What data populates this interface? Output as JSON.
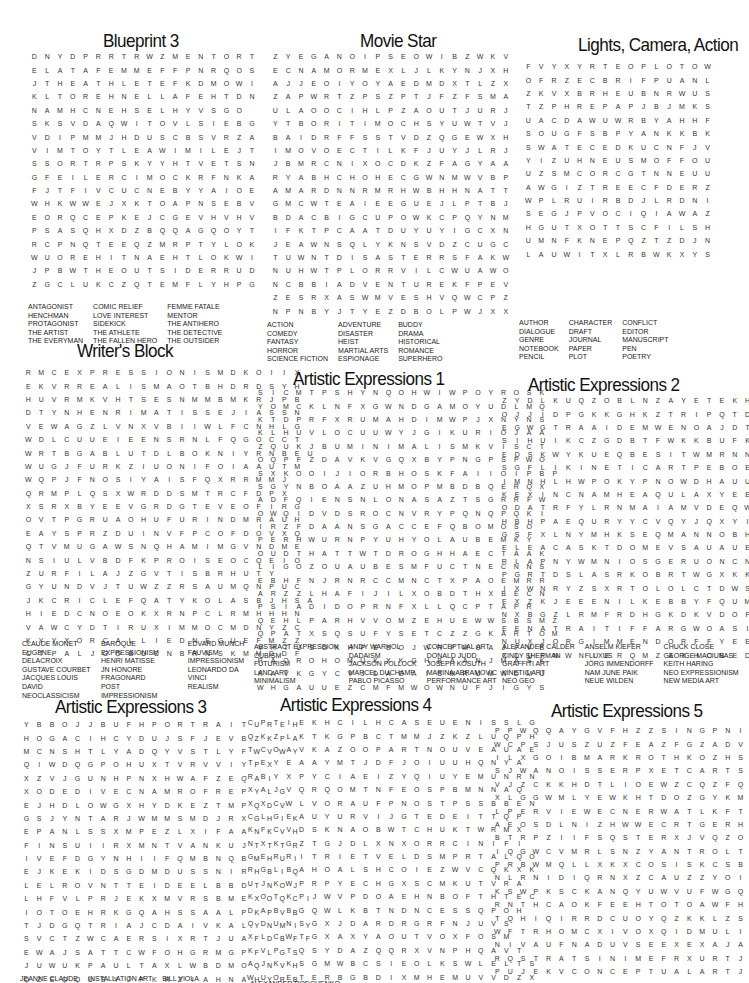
{
  "puzzles": [
    {
      "title": "Blueprint 3",
      "rows": [
        "DNYDPRRTRWZMENTORT",
        "ELATAFEMMEFFPNRQOS",
        "JTHEATHLETEFKDMOWI",
        "KLTOREHNELLAFEHTDN",
        "NAMHCNEHSELHYVSGO",
        "SKSVDAQWITOVLSIEBG",
        "VDIPMMJHDUSCBSVRZA",
        "VIMTOYTLEAWIMILEJT",
        "SSORTRPSKYYHTVETSN",
        "GFEILERCIMOCKRFNKA",
        "FJTFIVCUCNEBYYAIOE",
        "WHKWWEJXKTOAPNSEBV",
        "EORQCEPKEJCGEVHVHV",
        "PSASQHXDZBQQAGQOYT",
        "RCPNQTEEQZMRPTYLOK",
        "WUOREHITNAEHTLOKWI",
        "JPBWTHEOUTSIDERRUD",
        "ZGCLUKCZQTEMFLYHPG"
      ],
      "words": [
        [
          "ANTAGONIST",
          "HENCHMAN",
          "PROTAGONIST",
          "THE ARTIST",
          "THE EVERYMAN"
        ],
        [
          "COMIC RELIEF",
          "LOVE INTEREST",
          "SIDEKICK",
          "THE ATHLETE",
          "THE FALLEN HERO"
        ],
        [
          "FEMME FATALE",
          "MENTOR",
          "THE ANTIHERO",
          "THE DETECTIVE",
          "THE OUTSIDER"
        ]
      ]
    },
    {
      "title": "Movie Star",
      "rows": [
        "ZYEGANOIPSEOWIBZWKV",
        "ECNAMORMEXLJLKYNJXH",
        "AJJEOIYOYAEDMDXTLZX",
        "ZAPWRTZPSZPTJFZFSMA",
        "ULAOOCIHLPZAOUTJURJ",
        "YTBORITIMOCHSYUWTVJ",
        "BAIDRFFSSTVDZQGEWXH",
        "IMOVOECTILKFJUYJLRJ",
        "JBMRCNIXOCDKZFAGYAA",
        "RYABHCHOHECGWNMWVBP",
        "AMARDNNRMRHWBHHNATT",
        "GMCWTEAIEEGUEJLPTBJ",
        "BDACBIGCUPOWKCPQYNM",
        "IFKTPCAATDUYUYIGCXN",
        "JEAWNSQLYKNSVDZCUGC",
        "TUWNTDISASTERRSFAKW",
        "NUHWTPLORRVILCWUAWO",
        "NCBBIADVENTUREKFPEV",
        "ZESRXASWMVESHVQWCPZ",
        "NPNBYJTYEZDBOLPWJXX"
      ],
      "words": [
        [
          "ACTION",
          "COMEDY",
          "FANTASY",
          "HORROR",
          "SCIENCE FICTION"
        ],
        [
          "ADVENTURE",
          "DISASTER",
          "HEIST",
          "MARTIAL ARTS",
          "ESPIONAGE"
        ],
        [
          "BUDDY",
          "DRAMA",
          "HISTORICAL",
          "ROMANCE",
          "SUPERHERO"
        ]
      ]
    },
    {
      "title": "Lights, Camera, Action",
      "rows": [
        "FVYXYRTEOPLOTOW",
        "OFRZECBRIFPUANL",
        "ZKVXBRHEUBNRWUS",
        "TZPHREPAPJBJMKS",
        "UACDAWUWRBYAHHF",
        "SOUGFSBPYANKKBK",
        "SWATECEDKUCNFJV",
        "YIZUHNEUSMOFFOU",
        "UZSMCORCGTNNEUU",
        "AWGIZTREECFDERZ",
        "WPLRUIRBDJLRDNI",
        "SEGJPVOCIQIAWAZ",
        "HGUTXOTTSCFILSH",
        "UMNFKNEPQZTZDJN",
        "LAUWITXLRBWKXYS"
      ],
      "words": [
        [
          "AUTHOR",
          "DIALOGUE",
          "GENRE",
          "NOTEBOOK",
          "PENCIL"
        ],
        [
          "CHARACTER",
          "DRAFT",
          "JOURNAL",
          "PAPER",
          "PLOT"
        ],
        [
          "CONFLICT",
          "EDITOR",
          "MANUSCRIPT",
          "PEN",
          "POETRY"
        ]
      ]
    },
    {
      "title": "Writer's Block",
      "rows": [
        "RMCEXPRESSIONISMDKOIIX",
        "EKVRREALISMAOTBHDRDSYH",
        "HUVRMKVHTSESNMMBMKRJPB",
        "DTYNHENRIMATISSEJIASSN",
        "VEWAGZLVNXVBIIWLFCNHLG",
        "WDLCUUEIEENSRNLFQGOCCT",
        "WRTBGABLUTDLBOKNIYRNBEU",
        "WUGJFURKZIUONIFOIAAUTM",
        "WQPJFNOSIYAISFQXRRMMJ",
        "QRMPLQSXWRDDSMTRCFDPX",
        "XSRXBYEEVGRDGTEVEOFIRG",
        "OVTPGRUAOHUFURINDMRAUH",
        "EAYSPRZDUINVFPCOFDOVXQ",
        "QTVMUGAWSNQHAMIMGVNDME",
        "NSIULVBDFKPROISEOCQEIO",
        "ZURFILAJZGVTISBRHUTY",
        "GYUNDVJTUWZZRSAUMQNPUC",
        "JKCRICLEFQATYKOLASBJHSA",
        "HIEDCNOEOKXRNPCLRMHHHN",
        "VAWCYDTIRUXIMMOCMDNYZC",
        "KYYXORCALLIEDNEGUEFMZZ",
        "CTPALJGOBUCNBRNSKMMDDF"
      ],
      "words": [
        [
          "CLAUDE MONET",
          "EUGENE DELACROIX",
          "GUSTAVE COURBET",
          "JACQUES LOUIS DAVID",
          "NEOCLASSICISM"
        ],
        [
          "BAROQUE",
          "EXPRESSIONISM",
          "HENRI MATISSE",
          "JN HONORE FRAGONARD",
          "POST IMPRESSIONISM"
        ],
        [
          "EDVARD MUNCH",
          "FAUVISM",
          "IMPRESSIONISM",
          "LEONARDO DA VINCI",
          "REALISM"
        ]
      ]
    },
    {
      "title": "Artistic Expressions 1",
      "rows": [
        "SICMTPSHYNQOHWIWPOYROSK",
        "YOMCKLNFXGWNDGAMOYUDLMQ",
        "KTDPRFXRUMAHDIMWPJXNYNS",
        "KLHUVLOCUUWYJGIKURIOJAA",
        "ZQUKJBUMINIMALISMKVISCT",
        "OQPFZDAVKVGQXBYPNGPSPWO",
        "SXKOOIJIORBHOSKFAIIOIPBP",
        "SGYNBOAAZUHMOPMBDBQERQX",
        "ADFQIENSNLONASAZTSGRRFW",
        "OWQIDVDSROCNVRYPQNQPQKI",
        "IRZFDAANSGACCEFQBOMOSO",
        "PERHWURNPYUHYOLAUBEMKY",
        "OUDTHATTWTDROGHHAECTAAK",
        "LIGOZOUAUBESMFUCTNECNNS",
        "EBHFNJRNRCCMNCTXPAOEMRR",
        "ARZZLHAFIJILXOBDTHXBECN",
        "PSIADIDOPRNFXLLQCPTAPR",
        "QEHLPARHVVOMZEHUEWWSBSMZ",
        "QPATXSQSUFYSETCZZGKARTOM",
        "VHTUSOKHPESOJWRFMUAJFVE",
        "RAOROHOMUKXKGHBAANJMASK",
        "KAVKGYCVJDADAISMRUMWDMU",
        "WHGAUUEZCMFMWOWNUFJIGYS"
      ],
      "words": [
        [
          "ABSTRACT EXPRESSION",
          "CUBISM",
          "FUTURISM",
          "LAND ART",
          "MINIMALISM"
        ],
        [
          "ANDY WARHOL",
          "DADAISM",
          "JACKSON POLLOCK",
          "MARCEL DUCHAMP",
          "PABLO PICASSO"
        ],
        [
          "CONCEPTUAL ART",
          "DONALD JUDD",
          "JOSEPH KOSUTH",
          "MARINA ABRAMOVIC",
          "PERFORMANCE ART"
        ]
      ]
    },
    {
      "title": "Artistic Expressions 2",
      "rows": [
        "ZYDLKUQZOBLNZAYETEKHA",
        "OJJIDPGKKGHKZTRIPQTDF",
        "EGWGTRAAIDEMWENOAJDTU",
        "SIHUIKCZGDBTFWKKBUFKO",
        "EDSKWYKUEQBESITWMRNNE",
        "SGFLIKINETICARTPEBOEG",
        "IMNHLHWPOKYPNOWDHAUUO",
        "KEXINCNAMHEAQULAXYEE",
        "ODATRFYLRNMAIAMVDEQWN",
        "HBHPAEQURYYCVQYJQXYIO",
        "GSFXLNYMHKSEQMANNOBHB",
        "ELEACASKTDOMEVSAUAUEY",
        "RLAPNYWMNIOSGERUONCNW",
        "PGRTDSLASRKOBRTWGXKKL",
        "IXWNRYZSXRTOLOLCTDWSZ",
        "EXZKJEEENILKEBBYFQUMH",
        "NXBGZLRMFRDHGKDKVDOFB",
        "EENATRAITIFFARGWOASIZ",
        "NUXJORGIMMENDORFFYEEJ",
        "XLUFNWNIERQMZAXHOBEDQ"
      ],
      "words": [
        [
          "ALEXANDER CALDER",
          "CINDY SHERMAN",
          "GRAFFITI ART",
          "KINETIC ART",
          "NEO GEO"
        ],
        [
          "ANSELM KIEFER",
          "FLUXUS",
          "JÖRG IMMENDORFF",
          "NAM JUNE PAIK",
          "NEUE WILDEN"
        ],
        [
          "CHUCK CLOSE",
          "GEORGE MACIUNAS",
          "KEITH HARING",
          "NEO EXPRESSIONISM",
          "NEW MEDIA ART"
        ]
      ]
    },
    {
      "title": "Artistic Expressions 3",
      "rows": [
        "YBBOJJBUFHPORTRAITUREH",
        "HOGACIHCYDUJSFJEVBZKPA",
        "MCNSHTLYADQYVSTLYFWVWY",
        "QIWDQGPOHUXTVRVVIYPX",
        "XZVJGUNHPNXHWAFZEQAI",
        "XODEDIVECNAMROFREPYLG",
        "EJHDLOWGXHYDKEZTMPQDV",
        "GSJYNTARJWMMSMDJRXGHIK",
        "EPANLSSXMPEZLXIFAANKVH",
        "FINSUIIRXMNTVANKUJTTTR",
        "IVEFDGYNHIIFQMBNQBMHUI",
        "EJKEKIDSGDMDUSSNIRHBIQ",
        "LELROVNTTEIDEELBBDTNOJ",
        "LHFVLPRJEKXMVRSBMEXOQCI",
        "IOTOEHRKGQAHSSAALPKPVB",
        "TJDGQTRIAJCDAIVKALYNMIY",
        "SVCTZWCAERSIXRTJUAFDBFF",
        "EWAJSATTCWFOHGRMGPFLGS",
        "JUWUKPAULTAXLWBDMOQNVH",
        "QZEQQUSYJPKRZIAHNAHYRB",
        "OTYZZIVYURTQDAJLITUOCW",
        "VKPTJWAJRLMMORUTUXYOHV"
      ],
      "words": [
        [
          "JEANNE CLAUDE"
        ],
        [
          "INSTALLATION ART"
        ],
        [
          "BILL VIOLA"
        ]
      ]
    },
    {
      "title": "Artistic Expressions 4",
      "rows": [
        "CPTIEKHCILHCASEUENISSLG",
        "QKZLKTKGPBCTMMJZKZLUQPH",
        "TCOAVKAZOOPARTNOUVEAUAE",
        "TEYEAAYMTJDFJOIUUHQNYA",
        "RBYXPYCIAEIZYQIUYEMUNRN",
        "XAJVQRQOMTNFEOSPBMNNAQ",
        "XXCWLVORAUFPNOSTPSSBBEN",
        "CLGEAUYURVIJGTEDEITTQP",
        "KFCVDSKNAOBWTCHUKTWRMX",
        "NXKGZTGJDLXNXORRCINIFI",
        "GERRITRIETVELDSMPRTALQO",
        "RGLBAHOALSHCOIEZWVCQKXK",
        "UJKWPRPYECHGXSCMKUTVRA",
        "KOTKPJWVPDOAEHNBOFTHTEC",
        "DABBGQWLKBTNDNCESSQPOH",
        "QDUNSGXJDARDRGRFNJUVS",
        "XLCWTGXAXYAOUTVOXFOSM",
        "KVPTQSYDAZQQRXVNPHQAVT",
        "AJKKSGMWBCSIEOLKSWLELTS",
        "WUOETERBGBDIXMHEMUVVDZX",
        "YVJDZJDWKVFGMUDCHLARL",
        "TCALEXANDERRODCHENKOLOW"
      ],
      "words": [
        [
          "ALEXANDER RODCHENKO"
        ]
      ]
    },
    {
      "title": "Artistic Expressions 5",
      "rows": [
        "PPWQQAYGVFHZZSINGPNILMV",
        "WCPSJUSZUZFEAZFGZADVJAD",
        "ILXGOIBMARKROTHKOZHSMHS",
        "SJWANOISSERPXETCARTSBAE",
        "VJZCKKHDTLIOEWZCQZFQXRS",
        "XLGGWMLYEWKHTDOZGYKMQZ",
        "LPERVIEWECNERWATLKFTOHB",
        "AEOSDLNIZHWWECRTGERHLAK",
        "BTRPZIIFSQSTERXJVQZOD",
        "IQGWCVMRLSNZYANTROLTQVI",
        "PRBWMQLLXKXCOSISKCSBWNB",
        "NLRNIDIQRNXZCAUZZYOIAD",
        "KSWPKSCKANQYUWVUFWGQRH",
        "RNTHCAOKFEEHTOTOAWFHNT",
        "TQHIQIRRDCUOYQZKKLZSTE",
        "WFTRHOMCXIVOXQIDMULIHZ",
        "NIVAUFNADUVSEEXEXAJAGF",
        "RQSTRATSINIMEFRXURTJFTO",
        "PUJEKVCONCEPTUALARTJIGR",
        "BKPNZYVDHBVWRYFJFCRCGTS",
        "PMEKBRZKEARTHWORKSMCIVK",
        "CDASFWAVATFOEWREMZNTBYF"
      ],
      "words": []
    }
  ]
}
